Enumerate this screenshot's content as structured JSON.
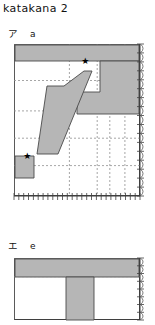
{
  "figure": {
    "title": "katakana 2",
    "background": "#ffffff",
    "ink_fill": "#b6b6b6",
    "ink_stroke": "#4a4a4a",
    "grid_dash_color": "#8f8f8f",
    "axis_color": "#3f3f3f",
    "star_glyph": "★"
  },
  "panels": [
    {
      "id": "panel-a",
      "kana": "ア",
      "romaji": "a",
      "label_x": 8,
      "label_y": 26,
      "plot": {
        "x": 14,
        "y": 44,
        "w": 126,
        "h": 152
      },
      "axes": {
        "bottom_ticks": 26,
        "right_ticks": 17,
        "tick_len": 4,
        "grid": true
      },
      "gridlines": {
        "vertical": [
          0.44,
          0.66,
          0.76,
          0.88
        ],
        "horizontal": [
          0.24,
          0.44,
          0.62,
          0.8
        ]
      },
      "ink_regions": [
        {
          "name": "top-horizontal-bar",
          "points": "1,1 125,1 125,17 1,17"
        },
        {
          "name": "upper-right-block",
          "points": "86,17 125,17 125,70 63,70 63,48 86,48"
        },
        {
          "name": "diagonal-sweep",
          "points": "33,42 50,42 70,27 78,27 44,110 23,110"
        },
        {
          "name": "lower-left-foot",
          "points": "1,112 20,112 20,134 1,134"
        }
      ],
      "stars": [
        {
          "name": "stroke-start-1",
          "x": 0.565,
          "y": 0.115
        },
        {
          "name": "stroke-start-2",
          "x": 0.105,
          "y": 0.735
        }
      ]
    },
    {
      "id": "panel-e",
      "kana": "エ",
      "romaji": "e",
      "label_x": 8,
      "label_y": 238,
      "plot": {
        "x": 14,
        "y": 258,
        "w": 126,
        "h": 62
      },
      "axes": {
        "bottom_ticks": 0,
        "right_ticks": 8,
        "tick_len": 4,
        "grid": true
      },
      "gridlines": {
        "vertical": [],
        "horizontal": [
          0.3
        ]
      },
      "ink_regions": [
        {
          "name": "top-horizontal-bar",
          "points": "1,1 125,1 125,19 1,19"
        },
        {
          "name": "vertical-stem",
          "points": "52,19 80,19 80,62 52,62"
        }
      ],
      "stars": []
    }
  ]
}
